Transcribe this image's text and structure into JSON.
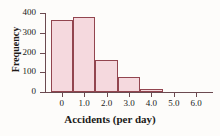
{
  "chart_data": {
    "type": "bar",
    "title": "",
    "subtitle": "",
    "xlabel": "Accidents (per day)",
    "ylabel": "Frequency",
    "categories": [
      "0",
      "1.0",
      "2.0",
      "3.0",
      "4.0",
      "5.0",
      "6.0"
    ],
    "bin_centers": [
      0,
      1,
      2,
      3,
      4,
      5,
      6
    ],
    "bin_edges": [
      -0.5,
      0.5,
      1.5,
      2.5,
      3.5,
      4.5,
      5.5,
      6.5
    ],
    "values": [
      365,
      380,
      160,
      75,
      15,
      0,
      0
    ],
    "x_tick_labels": [
      "0",
      "1.0",
      "2.0",
      "3.0",
      "4.0",
      "5.0",
      "6.0"
    ],
    "y_tick_labels": [
      "0",
      "100",
      "200",
      "300",
      "400"
    ],
    "y_ticks": [
      0,
      100,
      200,
      300,
      400
    ],
    "xlim": [
      -0.75,
      6.75
    ],
    "ylim": [
      0,
      400
    ],
    "grid": false,
    "legend": false,
    "legend_position": "none",
    "colors": {
      "bar_fill": "#f5d9de",
      "bar_border": "#92454f",
      "axis": "#6b4a50",
      "text": "#201a18",
      "background": "#fdfcfa"
    }
  }
}
